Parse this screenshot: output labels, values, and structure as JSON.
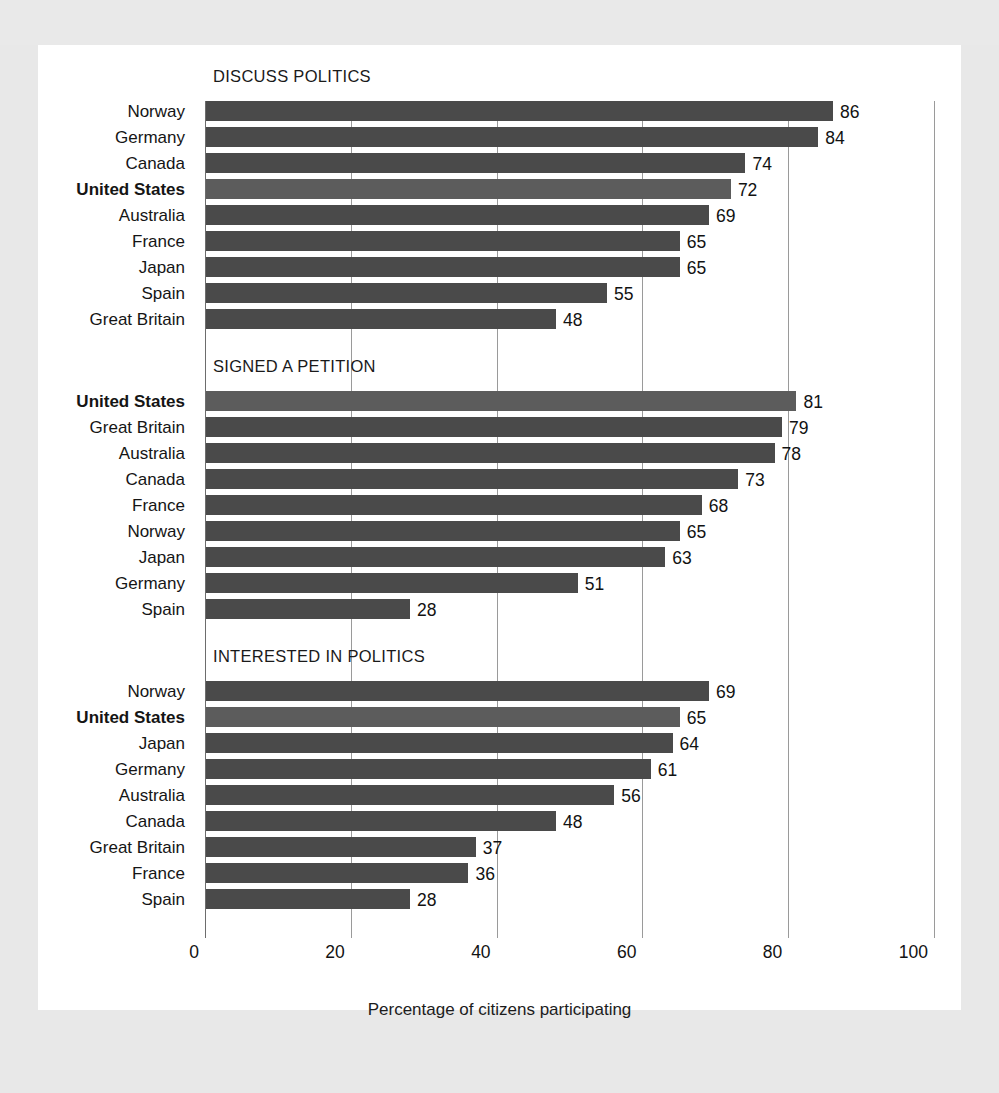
{
  "page": {
    "ghost_text": "",
    "background_color": "#e8e8e8",
    "card_color": "#ffffff"
  },
  "colors": {
    "bar": "#4a4a4a",
    "bar_highlight": "#5c5c5c",
    "gridline": "#9a9a9a",
    "axis": "#6d6d6d",
    "text": "#121212"
  },
  "chart_data": {
    "type": "bar",
    "orientation": "horizontal",
    "title": "",
    "xlabel": "Percentage of citizens participating",
    "ylabel": "",
    "xlim": [
      0,
      100
    ],
    "xticks": [
      0,
      20,
      40,
      60,
      80,
      100
    ],
    "xtick_labels": [
      "0",
      "20",
      "40",
      "60",
      "80",
      "100"
    ],
    "grid": true,
    "grid_axis": "x",
    "legend": "none",
    "highlight_category": "United States",
    "panels": [
      {
        "title": "DISCUSS POLITICS",
        "categories": [
          "Norway",
          "Germany",
          "Canada",
          "United States",
          "Australia",
          "France",
          "Japan",
          "Spain",
          "Great Britain"
        ],
        "values": [
          86,
          84,
          74,
          72,
          69,
          65,
          65,
          55,
          48
        ]
      },
      {
        "title": "SIGNED A PETITION",
        "categories": [
          "United States",
          "Great Britain",
          "Australia",
          "Canada",
          "France",
          "Norway",
          "Japan",
          "Germany",
          "Spain"
        ],
        "values": [
          81,
          79,
          78,
          73,
          68,
          65,
          63,
          51,
          28
        ]
      },
      {
        "title": "INTERESTED IN POLITICS",
        "categories": [
          "Norway",
          "United States",
          "Japan",
          "Germany",
          "Australia",
          "Canada",
          "Great Britain",
          "France",
          "Spain"
        ],
        "values": [
          69,
          65,
          64,
          61,
          56,
          48,
          37,
          36,
          28
        ]
      }
    ]
  }
}
